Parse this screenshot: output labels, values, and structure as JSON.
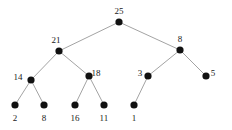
{
  "figure": {
    "name": "binary-tree-diagram",
    "background_color": "#ffffff",
    "node_color": "#111111",
    "edge_color": "#8c8c8c",
    "label_color": "#1a1a1a",
    "node_radius": 3.6,
    "edge_width": 0.8
  },
  "chart_data": {
    "type": "diagram",
    "title": "",
    "xlabel": "",
    "ylabel": "",
    "nodes": [
      {
        "id": "n25",
        "label": "25",
        "x": 119,
        "y": 22,
        "label_x": 119,
        "label_y": 11,
        "label_pos": "above"
      },
      {
        "id": "n21",
        "label": "21",
        "x": 59,
        "y": 51,
        "label_x": 56,
        "label_y": 40,
        "label_pos": "above-left"
      },
      {
        "id": "n8r",
        "label": "8",
        "x": 180,
        "y": 50,
        "label_x": 180,
        "label_y": 39,
        "label_pos": "above"
      },
      {
        "id": "n14",
        "label": "14",
        "x": 31,
        "y": 80,
        "label_x": 18,
        "label_y": 77,
        "label_pos": "left"
      },
      {
        "id": "n18",
        "label": "18",
        "x": 89,
        "y": 76,
        "label_x": 96,
        "label_y": 73,
        "label_pos": "right"
      },
      {
        "id": "n3",
        "label": "3",
        "x": 148,
        "y": 76,
        "label_x": 140,
        "label_y": 73,
        "label_pos": "left"
      },
      {
        "id": "n5",
        "label": "5",
        "x": 206,
        "y": 76,
        "label_x": 213,
        "label_y": 73,
        "label_pos": "right"
      },
      {
        "id": "n2",
        "label": "2",
        "x": 15,
        "y": 105,
        "label_x": 15,
        "label_y": 118,
        "label_pos": "below"
      },
      {
        "id": "n8l",
        "label": "8",
        "x": 44,
        "y": 105,
        "label_x": 44,
        "label_y": 118,
        "label_pos": "below"
      },
      {
        "id": "n16",
        "label": "16",
        "x": 75,
        "y": 105,
        "label_x": 75,
        "label_y": 118,
        "label_pos": "below"
      },
      {
        "id": "n11",
        "label": "11",
        "x": 104,
        "y": 105,
        "label_x": 104,
        "label_y": 118,
        "label_pos": "below"
      },
      {
        "id": "n1",
        "label": "1",
        "x": 134,
        "y": 105,
        "label_x": 134,
        "label_y": 118,
        "label_pos": "below"
      }
    ],
    "edges": [
      {
        "from": "n25",
        "to": "n21"
      },
      {
        "from": "n25",
        "to": "n8r"
      },
      {
        "from": "n21",
        "to": "n14"
      },
      {
        "from": "n21",
        "to": "n18"
      },
      {
        "from": "n14",
        "to": "n2"
      },
      {
        "from": "n14",
        "to": "n8l"
      },
      {
        "from": "n18",
        "to": "n16"
      },
      {
        "from": "n18",
        "to": "n11"
      },
      {
        "from": "n8r",
        "to": "n3"
      },
      {
        "from": "n8r",
        "to": "n5"
      },
      {
        "from": "n3",
        "to": "n1"
      }
    ]
  }
}
